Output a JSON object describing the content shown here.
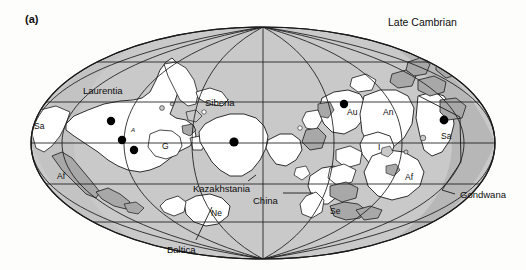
{
  "figure": {
    "panel_letter": "(a)",
    "era_title": "Late Cambrian",
    "background_color": "#fdfdfc",
    "ocean_color": "#c9c9c9",
    "ocean_shadow_color": "#b0b0b0",
    "land_color": "#ffffff",
    "shelf_color": "#a8a8a8",
    "line_color": "#1a1a1a",
    "marker_color": "#000000"
  },
  "map": {
    "projection": "mollweide-elliptical",
    "center_x": 263,
    "top_y": 27,
    "radius_x": 232,
    "radius_y": 116,
    "graticule": {
      "meridian_count": 9,
      "parallel_count": 4,
      "grid_visible": true
    }
  },
  "continent_labels": [
    {
      "name": "Laurentia",
      "text": "Laurentia",
      "x": 83,
      "y": 86,
      "size": "lbl-big"
    },
    {
      "name": "Siberia",
      "text": "Siberia",
      "x": 205,
      "y": 98,
      "size": "lbl-big"
    },
    {
      "name": "Kazakhstania",
      "text": "Kazakhstania",
      "x": 193,
      "y": 184,
      "size": "lbl-big"
    },
    {
      "name": "China",
      "text": "China",
      "x": 253,
      "y": 196,
      "size": "lbl-big"
    },
    {
      "name": "Baltica",
      "text": "Baltica",
      "x": 167,
      "y": 245,
      "size": "lbl-big"
    },
    {
      "name": "Gondwana",
      "text": "Gondwana",
      "x": 460,
      "y": 198,
      "size": "lbl-big"
    }
  ],
  "abbreviation_labels": [
    {
      "name": "south-america-west",
      "text": "Sa",
      "x": 34,
      "y": 127,
      "size": "lbl-mid"
    },
    {
      "name": "africa-west",
      "text": "Af",
      "x": 57,
      "y": 177,
      "size": "lbl-mid"
    },
    {
      "name": "greenland",
      "text": "G",
      "x": 162,
      "y": 147,
      "size": "lbl-mid"
    },
    {
      "name": "avalonia",
      "text": "A",
      "x": 131,
      "y": 131,
      "size": "lbl-xs"
    },
    {
      "name": "newfoundland",
      "text": "Ne",
      "x": 211,
      "y": 214,
      "size": "lbl-mid"
    },
    {
      "name": "australia",
      "text": "Au",
      "x": 347,
      "y": 113,
      "size": "lbl-mid"
    },
    {
      "name": "antarctica",
      "text": "An",
      "x": 383,
      "y": 113,
      "size": "lbl-mid"
    },
    {
      "name": "india",
      "text": "I",
      "x": 378,
      "y": 148,
      "size": "lbl-mid"
    },
    {
      "name": "south-america-east",
      "text": "Sa",
      "x": 444,
      "y": 137,
      "size": "lbl-mid"
    },
    {
      "name": "africa-east",
      "text": "Af",
      "x": 405,
      "y": 178,
      "size": "lbl-mid"
    },
    {
      "name": "se-asia",
      "text": "Se",
      "x": 330,
      "y": 212,
      "size": "lbl-mid"
    }
  ],
  "pole_markers": [
    {
      "name": "pole-marker-laurentia-north",
      "x": 111,
      "y": 121,
      "r": 4.2
    },
    {
      "name": "pole-marker-laurentia-mid",
      "x": 122,
      "y": 140,
      "r": 4.2
    },
    {
      "name": "pole-marker-laurentia-south",
      "x": 134,
      "y": 150,
      "r": 4.2
    },
    {
      "name": "pole-marker-siberia",
      "x": 234,
      "y": 142,
      "r": 4.6
    },
    {
      "name": "pole-marker-australia",
      "x": 344,
      "y": 104,
      "r": 4.2
    },
    {
      "name": "pole-marker-south-america",
      "x": 444,
      "y": 120,
      "r": 4.4
    }
  ],
  "leader_lines": [
    {
      "name": "leader-baltica",
      "d": "M 196 240 L 212 207"
    },
    {
      "name": "leader-china",
      "d": "M 283 193 L 313 193"
    },
    {
      "name": "leader-kazakhstania",
      "d": "M 248 181 L 256 175"
    }
  ],
  "gondwana_bracket": {
    "name": "gondwana-bracket",
    "d": "M 419 96 L 460 117 L 461 162 L 442 190 L 455 194"
  }
}
